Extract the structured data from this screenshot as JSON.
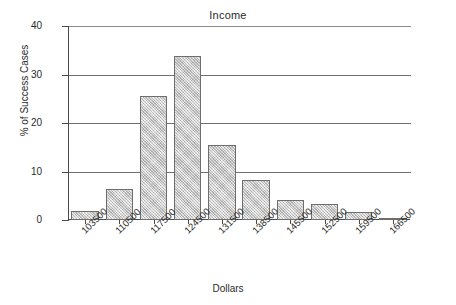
{
  "chart_data": {
    "type": "bar",
    "title": "Income",
    "xlabel": "Dollars",
    "ylabel": "% of Success Cases",
    "categories": [
      "103500",
      "110500",
      "117500",
      "124500",
      "131500",
      "138500",
      "145500",
      "152500",
      "159500",
      "166500"
    ],
    "values": [
      1.8,
      6.4,
      25.6,
      33.8,
      15.4,
      8.2,
      4.1,
      3.2,
      1.7,
      0.5
    ],
    "ylim": [
      0,
      40
    ],
    "yticks": [
      0,
      10,
      20,
      30,
      40
    ],
    "ytick_labels": [
      "0",
      "10",
      "20",
      "30",
      "40"
    ],
    "grid": true,
    "legend": false,
    "series_name": "% of Success Cases",
    "bar_fill_color": "#c9c9c9",
    "bar_border_color": "#6e6e6e",
    "axis_color": "#4a4a4a",
    "grid_color": "#707070"
  }
}
